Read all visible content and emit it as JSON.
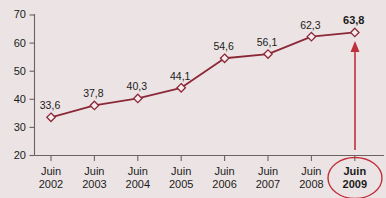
{
  "chart_data": {
    "type": "line",
    "title": "",
    "subtitle": "",
    "xlabel": "",
    "ylabel": "",
    "categories": [
      "Juin\n2002",
      "Juin\n2003",
      "Juin\n2004",
      "Juin\n2005",
      "Juin\n2006",
      "Juin\n2007",
      "Juin\n2008",
      "Juin\n2009"
    ],
    "category_lines": [
      {
        "top": "Juin",
        "bottom": "2002"
      },
      {
        "top": "Juin",
        "bottom": "2003"
      },
      {
        "top": "Juin",
        "bottom": "2004"
      },
      {
        "top": "Juin",
        "bottom": "2005"
      },
      {
        "top": "Juin",
        "bottom": "2006"
      },
      {
        "top": "Juin",
        "bottom": "2007"
      },
      {
        "top": "Juin",
        "bottom": "2008"
      },
      {
        "top": "Juin",
        "bottom": "2009"
      }
    ],
    "values": [
      33.6,
      37.8,
      40.3,
      44.1,
      54.6,
      56.1,
      62.3,
      63.8
    ],
    "value_labels": [
      "33,6",
      "37,8",
      "40,3",
      "44,1",
      "54,6",
      "56,1",
      "62,3",
      "63,8"
    ],
    "ylim": [
      20,
      70
    ],
    "yticks": [
      20,
      30,
      40,
      50,
      60,
      70
    ],
    "ytick_labels": [
      "20",
      "30",
      "40",
      "50",
      "60",
      "70"
    ],
    "grid": false,
    "legend": false,
    "marker": "diamond",
    "highlight": {
      "category_index": 7,
      "category_top": "Juin",
      "category_bottom": "2009",
      "value_label": "63,8",
      "annotation": "arrow-up"
    },
    "colors": {
      "background": "#ece4e4",
      "line": "#8b2838",
      "marker_fill": "#f6eeee",
      "axis": "#6d6060",
      "text": "#1b1b1b",
      "highlight": "#c0303a"
    }
  }
}
